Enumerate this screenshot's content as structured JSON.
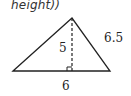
{
  "caption": {
    "text": "height))"
  },
  "triangle": {
    "vertices": {
      "apex": [
        72,
        18
      ],
      "left": [
        13,
        71
      ],
      "right": [
        110,
        71
      ]
    },
    "altitude_foot": [
      72,
      71
    ],
    "stroke_color": "#222222"
  },
  "labels": {
    "height": "5",
    "side": "6.5",
    "base": "6"
  }
}
